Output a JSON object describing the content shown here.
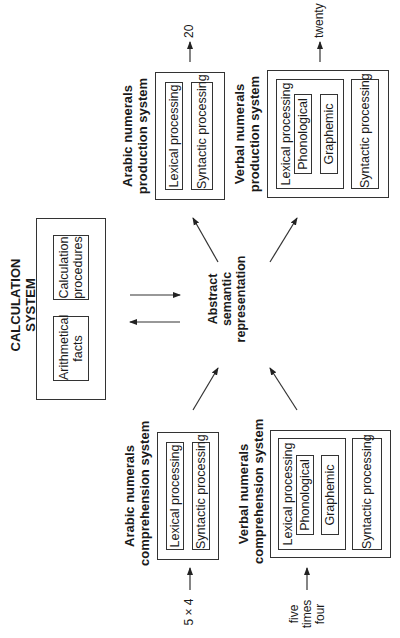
{
  "calculation_system": {
    "title_line1": "CALCULATION",
    "title_line2": "SYSTEM",
    "items": [
      {
        "line1": "Arithmetical",
        "line2": "facts"
      },
      {
        "line1": "Calculation",
        "line2": "procedures"
      }
    ]
  },
  "semantic": {
    "line1": "Abstract",
    "line2": "semantic",
    "line3": "representation"
  },
  "arabic_comprehension": {
    "title_line1": "Arabic numerals",
    "title_line2": "comprehension system",
    "lexical": "Lexical processing",
    "syntactic": "Syntactic processing",
    "input": "5 × 4"
  },
  "verbal_comprehension": {
    "title_line1": "Verbal numerals",
    "title_line2": "comprehension system",
    "lexical": "Lexical processing",
    "phonological": "Phonological",
    "graphemic": "Graphemic",
    "syntactic": "Syntactic processing",
    "input_line1": "five",
    "input_line2": "times",
    "input_line3": "four"
  },
  "arabic_production": {
    "title_line1": "Arabic numerals",
    "title_line2": "production system",
    "lexical": "Lexical processing",
    "syntactic": "Syntactic processing",
    "output": "20"
  },
  "verbal_production": {
    "title_line1": "Verbal numerals",
    "title_line2": "production system",
    "lexical": "Lexical processing",
    "phonological": "Phonological",
    "graphemic": "Graphemic",
    "syntactic": "Syntactic processing",
    "output": "twenty"
  }
}
